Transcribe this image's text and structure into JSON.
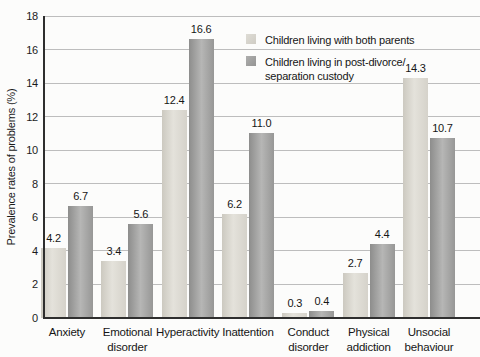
{
  "chart_data": {
    "type": "bar",
    "title": "",
    "xlabel": "",
    "ylabel": "Prevalence rates of problems (%)",
    "categories": [
      "Anxiety",
      "Emotional disorder",
      "Hyperactivity",
      "Inattention",
      "Conduct disorder",
      "Physical addiction",
      "Unsocial behaviour"
    ],
    "category_label_lines": [
      [
        "Anxiety"
      ],
      [
        "Emotional",
        "disorder"
      ],
      [
        "Hyperactivity"
      ],
      [
        "Inattention"
      ],
      [
        "Conduct",
        "disorder"
      ],
      [
        "Physical",
        "addiction"
      ],
      [
        "Unsocial",
        "behaviour"
      ]
    ],
    "series": [
      {
        "name": "Children living with both parents",
        "values": [
          4.2,
          3.4,
          12.4,
          6.2,
          0.3,
          2.7,
          14.3
        ],
        "value_labels": [
          "4.2",
          "3.4",
          "12.4",
          "6.2",
          "0.3",
          "2.7",
          "14.3"
        ],
        "color": "#d8d6ce"
      },
      {
        "name": "Children living in post-divorce/ separation custody",
        "values": [
          6.7,
          5.6,
          16.6,
          11.0,
          0.4,
          4.4,
          10.7
        ],
        "value_labels": [
          "6.7",
          "5.6",
          "16.6",
          "11.0",
          "0.4",
          "4.4",
          "10.7"
        ],
        "color": "#a3a3a2"
      }
    ],
    "ylim": [
      0,
      18
    ],
    "ytick_step": 2,
    "yticks": [
      0,
      2,
      4,
      6,
      8,
      10,
      12,
      14,
      16,
      18
    ],
    "grid": true,
    "legend_position": "top-right"
  },
  "legend": {
    "items": [
      {
        "lines": [
          "Children living with both parents"
        ],
        "swatch_color": "#d8d6ce"
      },
      {
        "lines": [
          "Children living in post-divorce/",
          "separation custody"
        ],
        "swatch_color": "#a3a3a2"
      }
    ]
  },
  "colors": {
    "grid": "#bdbdbd",
    "axis": "#2e2e2e",
    "text": "#1b1b1b",
    "bar_light": "#d8d6ce",
    "bar_dark": "#a3a3a2"
  }
}
